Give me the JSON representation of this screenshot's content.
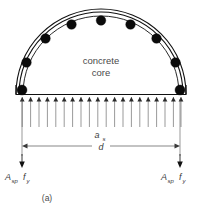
{
  "figure": {
    "caption": "(a)",
    "core_label_line1": "concrete",
    "core_label_line2": "core",
    "dimension_as_base": "a",
    "dimension_as_sub": "s",
    "dimension_d": "d",
    "force_left_main": "A",
    "force_left_sub": "sp",
    "force_left_second": "f",
    "force_left_second_sub": "y",
    "force_right_main": "A",
    "force_right_sub": "sp",
    "force_right_second": "f",
    "force_right_second_sub": "y",
    "colors": {
      "background": "#ffffff",
      "outline": "#111111",
      "rebar": "#0b0b0b",
      "load_arrow": "#6e6e6e",
      "dimension": "#555555",
      "text": "#3b3b3b"
    },
    "geometry": {
      "arch_center_x": 101,
      "arch_base_y": 94,
      "outer_radius": 85,
      "inner_radius": 79,
      "base_left_x": 17,
      "base_right_x": 185,
      "load_arrow_count": 20,
      "load_arrow_top_y": 96,
      "load_arrow_bottom_y": 127,
      "rebar_count": 9,
      "rebar_radius": 4.6,
      "dim_line_y": 146,
      "dim_tick_top_y": 131,
      "force_arrow_bottom_y": 165
    },
    "rebar_angles_deg": [
      0,
      22.5,
      45,
      67.5,
      90,
      112.5,
      135,
      157.5,
      180
    ],
    "icons": {
      "load_arrow": "down-arrow",
      "dimension_arrow": "double-headed-arrow",
      "force_arrow": "down-arrow"
    }
  }
}
